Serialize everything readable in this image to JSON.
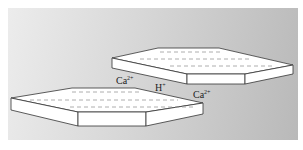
{
  "diagram": {
    "colors": {
      "background_light": "#ececec",
      "background_dark": "#b9b9b9",
      "plate_fill": "#ffffff",
      "plate_stroke": "#333333",
      "dash_color": "#999999"
    },
    "labels": [
      {
        "base": "Ca",
        "charge": "2+"
      },
      {
        "base": "H",
        "charge": "+"
      },
      {
        "base": "Ca",
        "charge": "2+"
      }
    ]
  }
}
